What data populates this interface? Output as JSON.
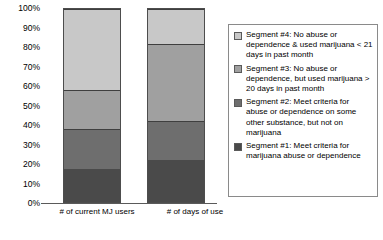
{
  "chart_data": {
    "type": "bar",
    "subtype": "100% stacked bar",
    "title": "",
    "xlabel": "",
    "ylabel": "",
    "ylim": [
      0,
      100
    ],
    "grid": false,
    "legend_position": "right",
    "categories": [
      "# of current MJ users",
      "# of days of use"
    ],
    "y_ticks": [
      "0%",
      "10%",
      "20%",
      "30%",
      "40%",
      "50%",
      "60%",
      "70%",
      "80%",
      "90%",
      "100%"
    ],
    "y_tick_values": [
      0,
      10,
      20,
      30,
      40,
      50,
      60,
      70,
      80,
      90,
      100
    ],
    "series": [
      {
        "name": "Segment #1: Meet criteria for marijuana abuse or dependence",
        "short_name": "Segment #1",
        "color": "#4a4a4a",
        "values": [
          17,
          22
        ]
      },
      {
        "name": "Segment #2: Meet criteria for abuse or dependence on some other substance, but not on marijuana",
        "short_name": "Segment #2",
        "color": "#6e6e6e",
        "values": [
          21,
          20
        ]
      },
      {
        "name": "Segment #3: No abuse or dependence, but used marijuana > 20 days in past month",
        "short_name": "Segment #3",
        "color": "#a0a0a0",
        "values": [
          20,
          40
        ]
      },
      {
        "name": "Segment #4: No abuse or dependence & used marijuana < 21 days in past month",
        "short_name": "Segment #4",
        "color": "#c8c8c8",
        "values": [
          42,
          18
        ]
      }
    ],
    "cumulative_boundaries": {
      "# of current MJ users": [
        17,
        38,
        58,
        100
      ],
      "# of days of use": [
        22,
        42,
        82,
        100
      ]
    }
  },
  "legend": {
    "items": [
      {
        "label": "Segment #4: No abuse or dependence & used marijuana < 21 days in past month",
        "color": "#c8c8c8"
      },
      {
        "label": "Segment #3: No abuse or dependence, but used marijuana > 20 days in past month",
        "color": "#a0a0a0"
      },
      {
        "label": "Segment #2: Meet criteria for abuse or dependence on some other substance, but not on marijuana",
        "color": "#6e6e6e"
      },
      {
        "label": "Segment #1: Meet criteria for marijuana abuse or dependence",
        "color": "#4a4a4a"
      }
    ]
  },
  "axis": {
    "x_labels": [
      "# of current MJ users",
      "# of days of use"
    ]
  }
}
